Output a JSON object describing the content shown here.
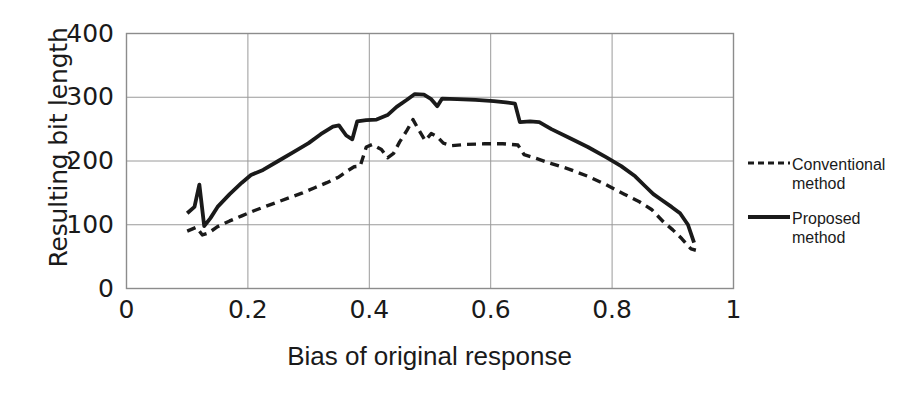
{
  "chart_data": {
    "type": "line",
    "title": "",
    "xlabel": "Bias of original response",
    "ylabel": "Resulting bit length",
    "xlim": [
      0,
      1
    ],
    "ylim": [
      0,
      400
    ],
    "xticks": [
      "0",
      "0.2",
      "0.4",
      "0.6",
      "0.8",
      "1"
    ],
    "xtick_values": [
      0,
      0.2,
      0.4,
      0.6,
      0.8,
      1
    ],
    "yticks": [
      "0",
      "100",
      "200",
      "300",
      "400"
    ],
    "ytick_values": [
      0,
      100,
      200,
      300,
      400
    ],
    "grid": true,
    "legend_position": "right",
    "series": [
      {
        "name": "Conventional method",
        "style": "dashed",
        "color": "#1a1a1a",
        "points": [
          [
            0.1,
            90
          ],
          [
            0.115,
            96
          ],
          [
            0.125,
            84
          ],
          [
            0.135,
            87
          ],
          [
            0.15,
            97
          ],
          [
            0.17,
            106
          ],
          [
            0.19,
            114
          ],
          [
            0.21,
            122
          ],
          [
            0.23,
            129
          ],
          [
            0.25,
            136
          ],
          [
            0.27,
            143
          ],
          [
            0.29,
            150
          ],
          [
            0.31,
            158
          ],
          [
            0.33,
            166
          ],
          [
            0.35,
            175
          ],
          [
            0.365,
            185
          ],
          [
            0.375,
            191
          ],
          [
            0.385,
            192
          ],
          [
            0.395,
            222
          ],
          [
            0.405,
            226
          ],
          [
            0.42,
            218
          ],
          [
            0.43,
            205
          ],
          [
            0.44,
            212
          ],
          [
            0.45,
            230
          ],
          [
            0.462,
            248
          ],
          [
            0.472,
            265
          ],
          [
            0.482,
            248
          ],
          [
            0.492,
            232
          ],
          [
            0.502,
            243
          ],
          [
            0.512,
            238
          ],
          [
            0.522,
            228
          ],
          [
            0.535,
            224
          ],
          [
            0.56,
            226
          ],
          [
            0.59,
            227
          ],
          [
            0.62,
            227
          ],
          [
            0.645,
            225
          ],
          [
            0.655,
            210
          ],
          [
            0.675,
            204
          ],
          [
            0.7,
            196
          ],
          [
            0.73,
            187
          ],
          [
            0.76,
            176
          ],
          [
            0.79,
            163
          ],
          [
            0.82,
            148
          ],
          [
            0.845,
            136
          ],
          [
            0.865,
            124
          ],
          [
            0.885,
            104
          ],
          [
            0.9,
            92
          ],
          [
            0.915,
            78
          ],
          [
            0.93,
            62
          ],
          [
            0.938,
            60
          ]
        ]
      },
      {
        "name": "Proposed method",
        "style": "solid",
        "color": "#1a1a1a",
        "points": [
          [
            0.1,
            118
          ],
          [
            0.112,
            128
          ],
          [
            0.12,
            163
          ],
          [
            0.128,
            98
          ],
          [
            0.138,
            110
          ],
          [
            0.15,
            128
          ],
          [
            0.17,
            148
          ],
          [
            0.19,
            166
          ],
          [
            0.205,
            178
          ],
          [
            0.225,
            186
          ],
          [
            0.25,
            200
          ],
          [
            0.275,
            214
          ],
          [
            0.3,
            228
          ],
          [
            0.32,
            242
          ],
          [
            0.34,
            254
          ],
          [
            0.35,
            256
          ],
          [
            0.362,
            240
          ],
          [
            0.372,
            234
          ],
          [
            0.38,
            262
          ],
          [
            0.395,
            264
          ],
          [
            0.412,
            265
          ],
          [
            0.43,
            272
          ],
          [
            0.445,
            285
          ],
          [
            0.462,
            296
          ],
          [
            0.475,
            305
          ],
          [
            0.49,
            304
          ],
          [
            0.502,
            297
          ],
          [
            0.512,
            286
          ],
          [
            0.52,
            298
          ],
          [
            0.545,
            297
          ],
          [
            0.575,
            296
          ],
          [
            0.605,
            294
          ],
          [
            0.625,
            292
          ],
          [
            0.64,
            290
          ],
          [
            0.648,
            261
          ],
          [
            0.665,
            262
          ],
          [
            0.68,
            261
          ],
          [
            0.7,
            250
          ],
          [
            0.73,
            236
          ],
          [
            0.76,
            222
          ],
          [
            0.79,
            206
          ],
          [
            0.815,
            192
          ],
          [
            0.838,
            176
          ],
          [
            0.855,
            160
          ],
          [
            0.868,
            148
          ],
          [
            0.88,
            140
          ],
          [
            0.898,
            128
          ],
          [
            0.912,
            118
          ],
          [
            0.925,
            100
          ],
          [
            0.935,
            72
          ]
        ]
      }
    ]
  },
  "legend": {
    "items": [
      {
        "label": "Conventional method",
        "style": "dashed"
      },
      {
        "label": "Proposed method",
        "style": "solid"
      }
    ]
  }
}
